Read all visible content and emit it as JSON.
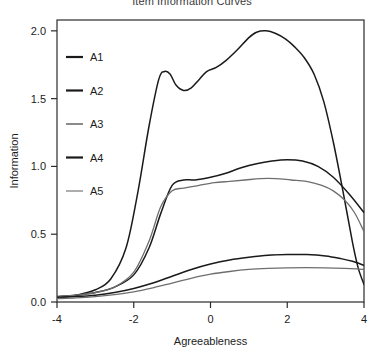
{
  "chart_data": {
    "type": "line",
    "title": "Item Information Curves",
    "xlabel": "Agreeableness",
    "ylabel": "Information",
    "xlim": [
      -4,
      4
    ],
    "ylim": [
      0.0,
      2.08
    ],
    "xticks": [
      -4,
      -2,
      0,
      2,
      4
    ],
    "xtick_labels": [
      "-4",
      "-2",
      "0",
      "2",
      "4"
    ],
    "yticks": [
      0.0,
      0.5,
      1.0,
      1.5,
      2.0
    ],
    "ytick_labels": [
      "0.0",
      "0.5",
      "1.0",
      "1.5",
      "2.0"
    ],
    "grid": false,
    "legend_position": "left-inside",
    "box": true,
    "series": [
      {
        "name": "A1",
        "color": "#1a1a1a",
        "width": 1.5,
        "x": [
          -4.0,
          -3.5,
          -3.0,
          -2.5,
          -2.0,
          -1.6,
          -1.3,
          -1.0,
          -0.7,
          -0.4,
          0.0,
          0.4,
          0.8,
          1.2,
          1.6,
          2.0,
          2.4,
          2.8,
          3.2,
          3.6,
          4.0
        ],
        "y": [
          0.04,
          0.05,
          0.07,
          0.11,
          0.2,
          0.4,
          0.65,
          0.86,
          0.9,
          0.9,
          0.92,
          0.95,
          0.99,
          1.02,
          1.04,
          1.05,
          1.04,
          1.0,
          0.92,
          0.8,
          0.66
        ]
      },
      {
        "name": "A2",
        "color": "#1a1a1a",
        "width": 1.5,
        "x": [
          -4.0,
          -3.5,
          -3.0,
          -2.6,
          -2.2,
          -1.9,
          -1.6,
          -1.35,
          -1.2,
          -1.05,
          -0.9,
          -0.7,
          -0.5,
          -0.3,
          -0.1,
          0.15,
          0.4,
          0.7,
          1.0,
          1.2,
          1.45,
          1.7,
          1.95,
          2.2,
          2.45,
          2.7,
          2.95,
          3.2,
          3.45,
          3.7,
          3.85,
          4.0
        ],
        "y": [
          0.03,
          0.05,
          0.09,
          0.17,
          0.4,
          0.8,
          1.3,
          1.64,
          1.7,
          1.68,
          1.6,
          1.56,
          1.58,
          1.64,
          1.7,
          1.73,
          1.78,
          1.86,
          1.95,
          1.99,
          2.0,
          1.98,
          1.94,
          1.88,
          1.8,
          1.68,
          1.48,
          1.18,
          0.82,
          0.44,
          0.25,
          0.13
        ]
      },
      {
        "name": "A3",
        "color": "#6e6e6e",
        "width": 1.3,
        "x": [
          -4.0,
          -3.5,
          -3.0,
          -2.5,
          -2.0,
          -1.6,
          -1.3,
          -1.0,
          -0.7,
          -0.3,
          0.1,
          0.5,
          0.9,
          1.3,
          1.7,
          2.1,
          2.5,
          2.9,
          3.2,
          3.5,
          3.75,
          4.0
        ],
        "y": [
          0.04,
          0.05,
          0.07,
          0.11,
          0.22,
          0.45,
          0.7,
          0.82,
          0.84,
          0.86,
          0.88,
          0.89,
          0.9,
          0.91,
          0.91,
          0.9,
          0.89,
          0.86,
          0.82,
          0.75,
          0.66,
          0.52
        ]
      },
      {
        "name": "A4",
        "color": "#1a1a1a",
        "width": 1.5,
        "x": [
          -4.0,
          -3.5,
          -3.0,
          -2.5,
          -2.0,
          -1.5,
          -1.0,
          -0.5,
          0.0,
          0.5,
          1.0,
          1.5,
          2.0,
          2.5,
          3.0,
          3.4,
          3.7,
          4.0
        ],
        "y": [
          0.035,
          0.04,
          0.05,
          0.07,
          0.1,
          0.14,
          0.19,
          0.24,
          0.28,
          0.31,
          0.33,
          0.345,
          0.35,
          0.35,
          0.34,
          0.32,
          0.3,
          0.27
        ]
      },
      {
        "name": "A5",
        "color": "#6e6e6e",
        "width": 1.3,
        "x": [
          -4.0,
          -3.5,
          -3.0,
          -2.5,
          -2.0,
          -1.5,
          -1.0,
          -0.5,
          0.0,
          0.5,
          1.0,
          1.5,
          2.0,
          2.5,
          3.0,
          3.5,
          3.8,
          4.0
        ],
        "y": [
          0.025,
          0.03,
          0.04,
          0.055,
          0.075,
          0.105,
          0.14,
          0.175,
          0.205,
          0.225,
          0.24,
          0.248,
          0.252,
          0.253,
          0.252,
          0.248,
          0.244,
          0.24
        ]
      }
    ],
    "legend": [
      {
        "label": "A1",
        "color": "#1a1a1a",
        "width": 2.2
      },
      {
        "label": "A2",
        "color": "#1a1a1a",
        "width": 2.2
      },
      {
        "label": "A3",
        "color": "#6e6e6e",
        "width": 1.6
      },
      {
        "label": "A4",
        "color": "#1a1a1a",
        "width": 2.2
      },
      {
        "label": "A5",
        "color": "#8a8a8a",
        "width": 1.4
      }
    ]
  },
  "colors": {
    "background": "#ffffff",
    "axis": "#2b2b2b",
    "text": "#1c1c1c"
  }
}
